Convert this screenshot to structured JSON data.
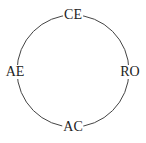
{
  "diagram": {
    "type": "cycle",
    "shape": "circle",
    "stroke_color": "#444444",
    "nodes": [
      {
        "id": "top",
        "label": "CE",
        "position": "top"
      },
      {
        "id": "right",
        "label": "RO",
        "position": "right"
      },
      {
        "id": "bottom",
        "label": "AC",
        "position": "bottom"
      },
      {
        "id": "left",
        "label": "AE",
        "position": "left"
      }
    ]
  }
}
